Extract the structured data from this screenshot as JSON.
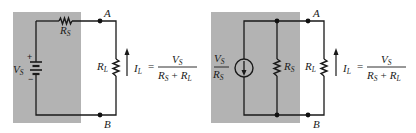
{
  "colors": {
    "source_box": "#b3b3b3",
    "wire": "#1a1a1a",
    "background": "#ffffff"
  },
  "left_circuit": {
    "title": "Voltage source with series resistance",
    "source": {
      "symbol": "V",
      "sub": "S",
      "plus": "+",
      "minus": "−"
    },
    "series_resistor": {
      "symbol": "R",
      "sub": "S"
    },
    "load_resistor": {
      "symbol": "R",
      "sub": "L"
    },
    "terminal_top": "A",
    "terminal_bottom": "B",
    "current": {
      "symbol": "I",
      "sub": "L",
      "equals": "="
    },
    "formula": {
      "num_sym": "V",
      "num_sub": "S",
      "den_a_sym": "R",
      "den_a_sub": "S",
      "den_plus": "+",
      "den_b_sym": "R",
      "den_b_sub": "L"
    }
  },
  "right_circuit": {
    "title": "Equivalent current source with parallel resistance",
    "source": {
      "num_sym": "V",
      "num_sub": "S",
      "den_sym": "R",
      "den_sub": "S"
    },
    "parallel_resistor": {
      "symbol": "R",
      "sub": "S"
    },
    "load_resistor": {
      "symbol": "R",
      "sub": "L"
    },
    "terminal_top": "A",
    "terminal_bottom": "B",
    "current": {
      "symbol": "I",
      "sub": "L",
      "equals": "="
    },
    "formula": {
      "num_sym": "V",
      "num_sub": "S",
      "den_a_sym": "R",
      "den_a_sub": "S",
      "den_plus": "+",
      "den_b_sym": "R",
      "den_b_sub": "L"
    }
  }
}
